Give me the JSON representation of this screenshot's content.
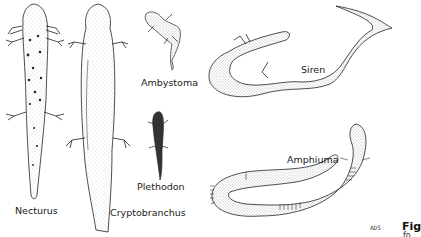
{
  "figure": {
    "animals": [
      {
        "name": "Necturus"
      },
      {
        "name": "Cryptobranchus"
      },
      {
        "name": "Ambystoma"
      },
      {
        "name": "Plethodon"
      },
      {
        "name": "Siren"
      },
      {
        "name": "Amphiuma"
      }
    ],
    "signature": "ADS",
    "caption_start": "Fig",
    "caption_line2_start": "fo"
  }
}
